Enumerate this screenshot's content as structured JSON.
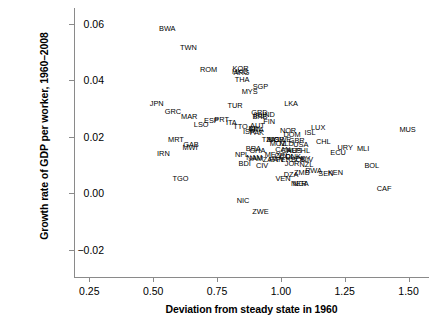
{
  "chart_data": {
    "type": "scatter",
    "title": "",
    "xlabel": "Deviation from steady state in 1960",
    "ylabel": "Growth rate of GDP per worker, 1960–2008",
    "xlim": [
      0.19,
      1.58
    ],
    "ylim": [
      -0.0295,
      0.0655
    ],
    "xticks": [
      0.25,
      0.5,
      0.75,
      1.0,
      1.25,
      1.5
    ],
    "xticklabels": [
      "0.25",
      "0.50",
      "0.75",
      "1.00",
      "1.25",
      "1.50"
    ],
    "yticks": [
      -0.02,
      0.0,
      0.02,
      0.04,
      0.06
    ],
    "yticklabels": [
      "−0.02",
      "0.00",
      "0.02",
      "0.04",
      "0.06"
    ],
    "grid": false,
    "legend": null,
    "marker_style": "text-label-only",
    "points": [
      {
        "label": "BWA",
        "x": 0.555,
        "y": 0.0586
      },
      {
        "label": "TWN",
        "x": 0.638,
        "y": 0.0517
      },
      {
        "label": "ROM",
        "x": 0.717,
        "y": 0.0441
      },
      {
        "label": "KOR",
        "x": 0.842,
        "y": 0.0444
      },
      {
        "label": "HKG",
        "x": 0.84,
        "y": 0.0434
      },
      {
        "label": "ARG",
        "x": 0.846,
        "y": 0.043
      },
      {
        "label": "THA",
        "x": 0.848,
        "y": 0.0404
      },
      {
        "label": "SGP",
        "x": 0.92,
        "y": 0.0381
      },
      {
        "label": "MYS",
        "x": 0.878,
        "y": 0.0361
      },
      {
        "label": "JPN",
        "x": 0.514,
        "y": 0.0318
      },
      {
        "label": "TUR",
        "x": 0.821,
        "y": 0.0314
      },
      {
        "label": "LKA",
        "x": 1.04,
        "y": 0.0318
      },
      {
        "label": "GRC",
        "x": 0.577,
        "y": 0.0292
      },
      {
        "label": "GRD",
        "x": 0.916,
        "y": 0.0286
      },
      {
        "label": "IRL",
        "x": 0.914,
        "y": 0.0276
      },
      {
        "label": "BRB",
        "x": 0.918,
        "y": 0.0272
      },
      {
        "label": "IND",
        "x": 0.952,
        "y": 0.0282
      },
      {
        "label": "MAR",
        "x": 0.641,
        "y": 0.0272
      },
      {
        "label": "ESP",
        "x": 0.728,
        "y": 0.0258
      },
      {
        "label": "PRT",
        "x": 0.768,
        "y": 0.0262
      },
      {
        "label": "ITA",
        "x": 0.806,
        "y": 0.0251
      },
      {
        "label": "LSO",
        "x": 0.688,
        "y": 0.0244
      },
      {
        "label": "FIN",
        "x": 0.954,
        "y": 0.0257
      },
      {
        "label": "LUX",
        "x": 1.146,
        "y": 0.0236
      },
      {
        "label": "TTO",
        "x": 0.842,
        "y": 0.024
      },
      {
        "label": "AUT",
        "x": 0.908,
        "y": 0.0243
      },
      {
        "label": "BEL",
        "x": 0.9,
        "y": 0.0231
      },
      {
        "label": "FRA",
        "x": 0.904,
        "y": 0.0228
      },
      {
        "label": "NOR",
        "x": 1.028,
        "y": 0.0224
      },
      {
        "label": "MUS",
        "x": 1.496,
        "y": 0.0229
      },
      {
        "label": "ISR",
        "x": 0.876,
        "y": 0.0219
      },
      {
        "label": "PAK",
        "x": 0.906,
        "y": 0.0216
      },
      {
        "label": "DOM",
        "x": 1.044,
        "y": 0.0211
      },
      {
        "label": "ISL",
        "x": 1.114,
        "y": 0.0216
      },
      {
        "label": "MRT",
        "x": 0.589,
        "y": 0.0192
      },
      {
        "label": "TZA",
        "x": 0.952,
        "y": 0.0191
      },
      {
        "label": "NIC",
        "x": 0.968,
        "y": 0.0192
      },
      {
        "label": "KOR2",
        "x": 0.982,
        "y": 0.0192
      },
      {
        "label": "SWE",
        "x": 1.008,
        "y": 0.0192
      },
      {
        "label": "GBR",
        "x": 1.062,
        "y": 0.019
      },
      {
        "label": "CHL",
        "x": 1.166,
        "y": 0.0186
      },
      {
        "label": "GAB",
        "x": 0.648,
        "y": 0.0176
      },
      {
        "label": "MOZ",
        "x": 0.988,
        "y": 0.0178
      },
      {
        "label": "NLD",
        "x": 1.022,
        "y": 0.0177
      },
      {
        "label": "USA",
        "x": 1.078,
        "y": 0.0176
      },
      {
        "label": "MWI",
        "x": 0.644,
        "y": 0.0163
      },
      {
        "label": "URY",
        "x": 1.252,
        "y": 0.0163
      },
      {
        "label": "MLI",
        "x": 1.322,
        "y": 0.016
      },
      {
        "label": "BRA",
        "x": 0.892,
        "y": 0.0159
      },
      {
        "label": "GHA",
        "x": 0.908,
        "y": 0.0155
      },
      {
        "label": "CAN",
        "x": 1.008,
        "y": 0.0158
      },
      {
        "label": "CHE",
        "x": 1.032,
        "y": 0.0155
      },
      {
        "label": "AUS",
        "x": 1.052,
        "y": 0.0154
      },
      {
        "label": "PHL",
        "x": 1.086,
        "y": 0.0152
      },
      {
        "label": "ECU",
        "x": 1.224,
        "y": 0.0147
      },
      {
        "label": "IRN",
        "x": 0.54,
        "y": 0.0143
      },
      {
        "label": "NPL",
        "x": 0.848,
        "y": 0.0139
      },
      {
        "label": "MEX",
        "x": 0.968,
        "y": 0.0139
      },
      {
        "label": "CRI",
        "x": 1.0,
        "y": 0.0136
      },
      {
        "label": "COL",
        "x": 1.024,
        "y": 0.0134
      },
      {
        "label": "DNK",
        "x": 1.048,
        "y": 0.0133
      },
      {
        "label": "NAM",
        "x": 0.896,
        "y": 0.0128
      },
      {
        "label": "JAM",
        "x": 0.902,
        "y": 0.0126
      },
      {
        "label": "ZAF",
        "x": 0.956,
        "y": 0.0122
      },
      {
        "label": "PAN",
        "x": 0.982,
        "y": 0.012
      },
      {
        "label": "PER",
        "x": 1.01,
        "y": 0.0122
      },
      {
        "label": "BOL",
        "x": 1.068,
        "y": 0.0122
      },
      {
        "label": "PRY",
        "x": 1.086,
        "y": 0.0124
      },
      {
        "label": "SLV",
        "x": 1.1,
        "y": 0.0122
      },
      {
        "label": "BDI",
        "x": 0.858,
        "y": 0.0108
      },
      {
        "label": "CIV",
        "x": 0.926,
        "y": 0.0102
      },
      {
        "label": "JOR",
        "x": 1.044,
        "y": 0.0106
      },
      {
        "label": "NZL",
        "x": 1.1,
        "y": 0.0104
      },
      {
        "label": "BOL2",
        "x": 1.356,
        "y": 0.01
      },
      {
        "label": "RWA",
        "x": 1.128,
        "y": 0.0083
      },
      {
        "label": "ZMB",
        "x": 1.082,
        "y": 0.0076
      },
      {
        "label": "SEN",
        "x": 1.176,
        "y": 0.0073
      },
      {
        "label": "KEN",
        "x": 1.214,
        "y": 0.0076
      },
      {
        "label": "DZA",
        "x": 1.04,
        "y": 0.007
      },
      {
        "label": "TGO",
        "x": 0.607,
        "y": 0.0055
      },
      {
        "label": "VEN",
        "x": 1.008,
        "y": 0.0055
      },
      {
        "label": "NER",
        "x": 1.07,
        "y": 0.0038
      },
      {
        "label": "NGA",
        "x": 1.078,
        "y": 0.0038
      },
      {
        "label": "CAF",
        "x": 1.404,
        "y": 0.002
      },
      {
        "label": "NIC2",
        "x": 0.852,
        "y": -0.0022
      },
      {
        "label": "ZWE",
        "x": 0.92,
        "y": -0.0062
      }
    ]
  },
  "axes": {
    "x_title": "Deviation from steady state in 1960",
    "y_title": "Growth rate of GDP per worker, 1960–2008",
    "x_tick_labels": [
      "0.25",
      "0.50",
      "0.75",
      "1.00",
      "1.25",
      "1.50"
    ],
    "y_tick_labels": [
      "0.06",
      "0.04",
      "0.02",
      "0.00",
      "−0.02"
    ]
  },
  "point_labels": {
    "p0": "BWA",
    "p1": "TWN",
    "p2": "ROM",
    "p3": "KOR",
    "p4": "HKG",
    "p5": "ARG",
    "p6": "THA",
    "p7": "SGP",
    "p8": "MYS",
    "p9": "JPN",
    "p10": "TUR",
    "p11": "LKA",
    "p12": "GRC",
    "p13": "GRD",
    "p14": "IRL",
    "p15": "BRB",
    "p16": "IND",
    "p17": "MAR",
    "p18": "ESP",
    "p19": "PRT",
    "p20": "ITA",
    "p21": "LSO",
    "p22": "FIN",
    "p23": "LUX",
    "p24": "TTO",
    "p25": "AUT",
    "p26": "BEL",
    "p27": "FRA",
    "p28": "NOR",
    "p29": "MUS",
    "p30": "ISR",
    "p31": "PAK",
    "p32": "DOM",
    "p33": "ISL",
    "p34": "MRT",
    "p35": "TZA",
    "p36": "NIC",
    "p37": "KOR",
    "p38": "SWE",
    "p39": "GBR",
    "p40": "CHL",
    "p41": "GAB",
    "p42": "MOZ",
    "p43": "NLD",
    "p44": "USA",
    "p45": "MWI",
    "p46": "URY",
    "p47": "MLI",
    "p48": "BRA",
    "p49": "GHA",
    "p50": "CAN",
    "p51": "CHE",
    "p52": "AUS",
    "p53": "PHL",
    "p54": "ECU",
    "p55": "IRN",
    "p56": "NPL",
    "p57": "MEX",
    "p58": "CRI",
    "p59": "COL",
    "p60": "DNK",
    "p61": "NAM",
    "p62": "JAM",
    "p63": "ZAF",
    "p64": "PAN",
    "p65": "PER",
    "p66": "BOL",
    "p67": "PRY",
    "p68": "SLV",
    "p69": "BDI",
    "p70": "CIV",
    "p71": "JOR",
    "p72": "NZL",
    "p73": "BOL",
    "p74": "RWA",
    "p75": "ZMB",
    "p76": "SEN",
    "p77": "KEN",
    "p78": "DZA",
    "p79": "TGO",
    "p80": "VEN",
    "p81": "NER",
    "p82": "NGA",
    "p83": "CAF",
    "p84": "NIC",
    "p85": "ZWE"
  }
}
